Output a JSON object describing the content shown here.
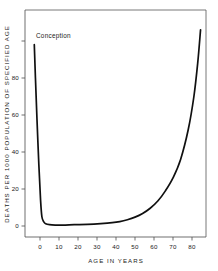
{
  "chart_data": {
    "type": "line",
    "title": "",
    "xlabel": "AGE  IN  YEARS",
    "ylabel": "DEATHS  PER  1000  POPULATION  OF  SPECIFIED  AGE",
    "xlim": [
      -5,
      88
    ],
    "ylim": [
      0,
      112
    ],
    "grid": false,
    "legend": null,
    "xticks": [
      0,
      10,
      20,
      30,
      40,
      50,
      60,
      70,
      80
    ],
    "xtick_labels": [
      "0",
      "10",
      "20",
      "30",
      "40",
      "50",
      "60",
      "70",
      "80"
    ],
    "yticks": [
      0,
      20,
      40,
      60,
      80,
      100
    ],
    "ytick_labels": [
      "0",
      "20",
      "40",
      "60",
      "80",
      ""
    ],
    "annotations": [
      {
        "text": "Conception",
        "x": -3,
        "y": 100
      }
    ],
    "series": [
      {
        "name": "Death rate by age",
        "x": [
          -3,
          -2.4,
          -1.6,
          -0.6,
          0.3,
          1.0,
          2.0,
          3.0,
          5.0,
          8.0,
          12.0,
          18.0,
          25.0,
          32.0,
          38.0,
          42.0,
          46.0,
          50.0,
          54.0,
          58.0,
          62.0,
          66.0,
          70.0,
          74.0,
          78.0,
          81.0,
          83.0,
          84.5
        ],
        "values": [
          98.0,
          80.0,
          58.0,
          33.0,
          14.0,
          5.0,
          2.2,
          1.2,
          0.7,
          0.5,
          0.5,
          0.7,
          0.9,
          1.3,
          1.8,
          2.4,
          3.4,
          4.8,
          6.8,
          9.6,
          13.5,
          19.0,
          26.0,
          36.0,
          52.0,
          70.0,
          88.0,
          106.0
        ]
      }
    ]
  }
}
